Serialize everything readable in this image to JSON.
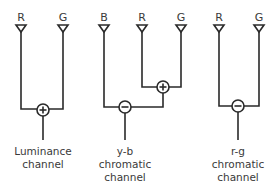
{
  "diagram": {
    "luminance": {
      "inputs": [
        {
          "label": "R"
        },
        {
          "label": "G"
        }
      ],
      "operator": "+",
      "caption": [
        "Luminance",
        "channel"
      ]
    },
    "yb": {
      "inputs": [
        {
          "label": "B"
        },
        {
          "label": "R"
        },
        {
          "label": "G"
        }
      ],
      "inner_operator": "+",
      "operator": "−",
      "caption": [
        "y-b",
        "chromatic",
        "channel"
      ]
    },
    "rg": {
      "inputs": [
        {
          "label": "R"
        },
        {
          "label": "G"
        }
      ],
      "operator": "−",
      "caption": [
        "r-g",
        "chromatic",
        "channel"
      ]
    }
  },
  "colors": {
    "line": "#2a2a2a",
    "text": "#3a3a3a",
    "background": "#ffffff"
  }
}
